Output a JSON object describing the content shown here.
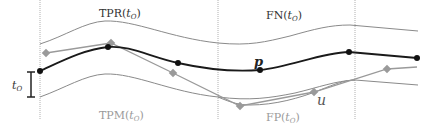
{
  "labels": {
    "tpr": "TPR(",
    "fn": "FN(",
    "tpm": "TPM(",
    "fp": "FP(",
    "t": "t",
    "sub_o": "O",
    "close": ")",
    "p": "p",
    "u": "u",
    "t_bar": "t",
    "t_bar_sub": "O"
  },
  "colors": {
    "p_path": "#1a1a1a",
    "u_path": "#9a9a9a",
    "envelope": "#8a8a8a",
    "divider": "#aaaaaa",
    "label_dark": "#333333",
    "label_light": "#9a9a9a"
  },
  "dividers_x": [
    40,
    218,
    355
  ],
  "p_points": [
    [
      40,
      71
    ],
    [
      108,
      47
    ],
    [
      178,
      63
    ],
    [
      260,
      70
    ],
    [
      349,
      52
    ],
    [
      417,
      58
    ]
  ],
  "u_points": [
    [
      46,
      53
    ],
    [
      111,
      43
    ],
    [
      173,
      73
    ],
    [
      240,
      106
    ],
    [
      314,
      92
    ],
    [
      387,
      69
    ]
  ]
}
